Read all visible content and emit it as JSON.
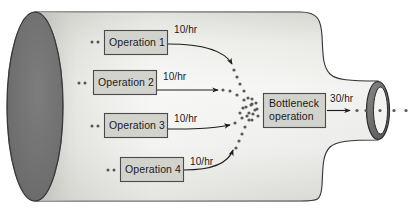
{
  "diagram": {
    "shape": "bottle",
    "colors": {
      "bottle_body_light": "#f2f2f0",
      "bottle_body_mid": "#dcdcd8",
      "bottle_body_dark": "#c9c9c4",
      "bottle_end_cap": "#6f6f6f",
      "bottle_end_cap_edge": "#3a3a3a",
      "neck_ring_fill": "#6f6f6f",
      "box_fill": "#d3d3ce",
      "box_stroke": "#4a4a4a",
      "outline": "#2b2b2b",
      "text": "#1a1a1a",
      "dot": "#555555"
    },
    "operations": [
      {
        "label": "Operation 1",
        "rate": "10/hr"
      },
      {
        "label": "Operation 2",
        "rate": "10/hr"
      },
      {
        "label": "Operation 3",
        "rate": "10/hr"
      },
      {
        "label": "Operation 4",
        "rate": "10/hr"
      }
    ],
    "bottleneck": {
      "line1": "Bottleneck",
      "line2": "operation",
      "output_rate": "30/hr"
    }
  }
}
